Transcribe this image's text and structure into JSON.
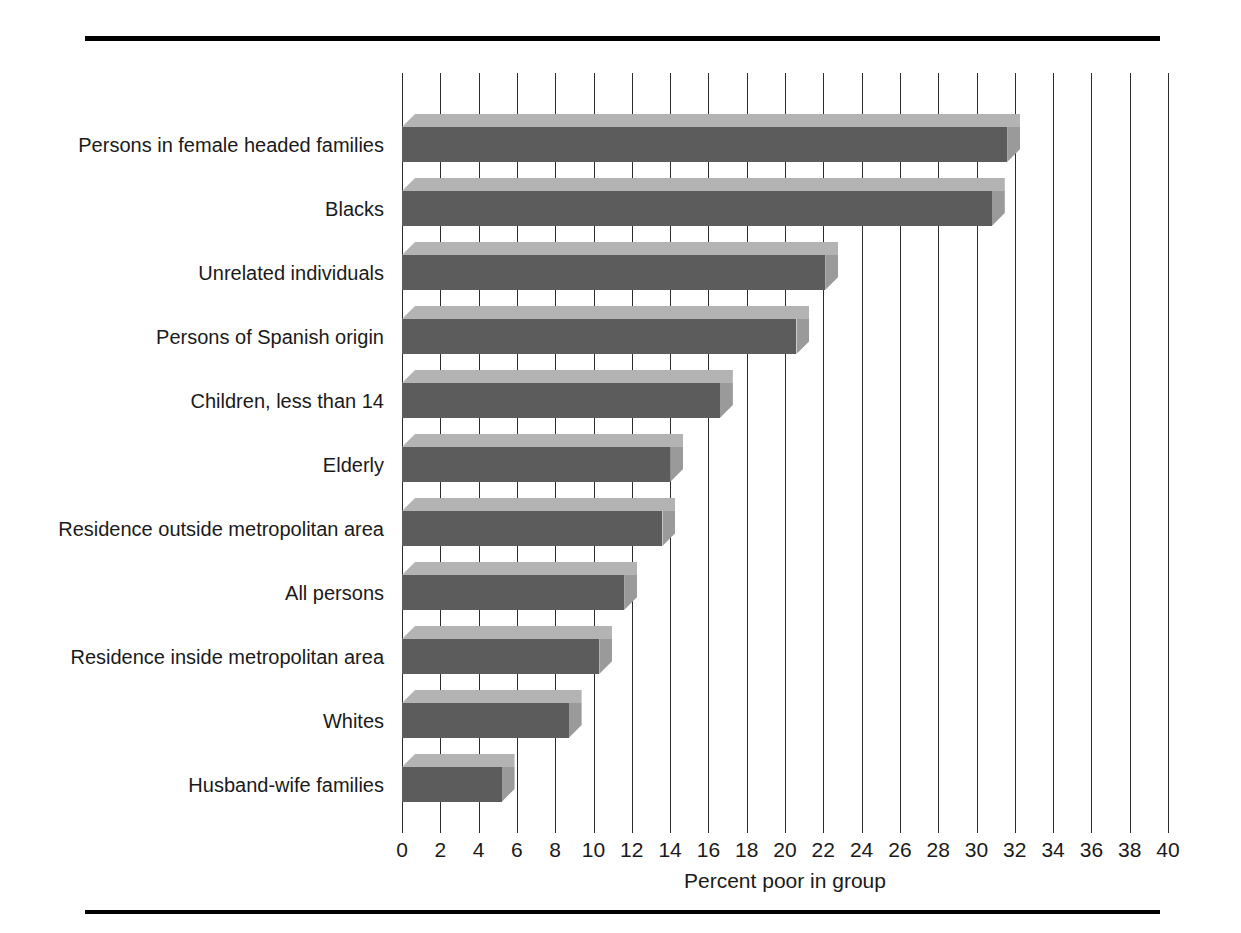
{
  "chart_data": {
    "type": "bar",
    "orientation": "horizontal",
    "title": "",
    "xlabel": "Percent poor in group",
    "ylabel": "",
    "xlim": [
      0,
      40
    ],
    "xtick_step": 2,
    "xticks": [
      0,
      2,
      4,
      6,
      8,
      10,
      12,
      14,
      16,
      18,
      20,
      22,
      24,
      26,
      28,
      30,
      32,
      34,
      36,
      38,
      40
    ],
    "xtick_labels": [
      "0",
      "2",
      "4",
      "6",
      "8",
      "10",
      "12",
      "14",
      "16",
      "18",
      "20",
      "22",
      "24",
      "26",
      "28",
      "30",
      "32",
      "34",
      "36",
      "38",
      "40"
    ],
    "grid": "vertical",
    "legend": "none",
    "categories": [
      "Persons in female headed families",
      "Blacks",
      "Unrelated individuals",
      "Persons of Spanish origin",
      "Children, less than 14",
      "Elderly",
      "Residence outside metropolitan area",
      "All persons",
      "Residence inside metropolitan area",
      "Whites",
      "Husband-wife families"
    ],
    "values": [
      31.6,
      30.8,
      22.1,
      20.6,
      16.6,
      14.0,
      13.6,
      11.6,
      10.3,
      8.7,
      5.2
    ],
    "colors": {
      "bar_front": "#5c5c5c",
      "bar_top": "#b3b3b3",
      "bar_side": "#9a9a9a",
      "gridline": "#2b2b2b",
      "rule": "#000000",
      "background": "#ffffff",
      "text": "#1a1a1a"
    }
  },
  "axis": {
    "x_title": "Percent poor in group"
  }
}
